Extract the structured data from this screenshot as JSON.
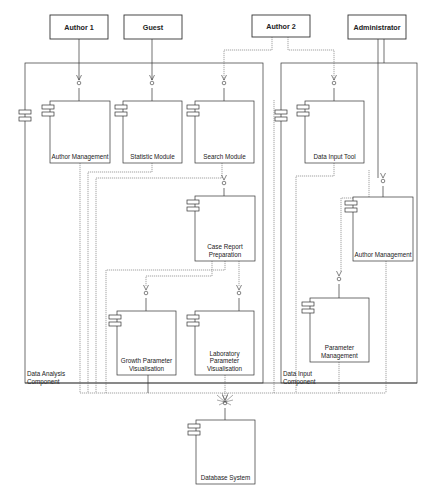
{
  "diagram": {
    "type": "UML component diagram",
    "colors": {
      "line": "#333333",
      "dashed": "#666666",
      "background": "#ffffff"
    },
    "actors": [
      {
        "id": "author1",
        "label": "Author 1",
        "x": 50,
        "y": 15,
        "w": 58,
        "h": 24
      },
      {
        "id": "guest",
        "label": "Guest",
        "x": 124,
        "y": 15,
        "w": 58,
        "h": 24
      },
      {
        "id": "author2",
        "label": "Author 2",
        "x": 252,
        "y": 15,
        "w": 58,
        "h": 22
      },
      {
        "id": "administrator",
        "label": "Administrator",
        "x": 348,
        "y": 15,
        "w": 58,
        "h": 24
      }
    ],
    "frames": [
      {
        "id": "data-analysis",
        "label_lines": [
          "Data Analysis",
          "Component"
        ],
        "x": 25,
        "y": 63,
        "w": 238,
        "h": 320,
        "label_x": 27,
        "label_y": 370
      },
      {
        "id": "data-input",
        "label_lines": [
          "Data Input",
          "Component"
        ],
        "x": 281,
        "y": 63,
        "w": 136,
        "h": 320,
        "label_x": 283,
        "label_y": 370
      }
    ],
    "components": [
      {
        "id": "author-mgmt-1",
        "label_lines": [
          "Author Management"
        ],
        "x": 50,
        "y": 101,
        "w": 60,
        "h": 62
      },
      {
        "id": "statistic-module",
        "label_lines": [
          "Statistic Module"
        ],
        "x": 123,
        "y": 101,
        "w": 59,
        "h": 62
      },
      {
        "id": "search-module",
        "label_lines": [
          "Search Module"
        ],
        "x": 195,
        "y": 101,
        "w": 59,
        "h": 62
      },
      {
        "id": "data-input-tool",
        "label_lines": [
          "Data Input Tool"
        ],
        "x": 305,
        "y": 101,
        "w": 59,
        "h": 62
      },
      {
        "id": "case-report",
        "label_lines": [
          "Case Report",
          "Preparation"
        ],
        "x": 195,
        "y": 196,
        "w": 60,
        "h": 65
      },
      {
        "id": "author-mgmt-2",
        "label_lines": [
          "Author Management"
        ],
        "x": 353,
        "y": 197,
        "w": 60,
        "h": 64
      },
      {
        "id": "growth-param",
        "label_lines": [
          "Growth Parameter",
          "Visualisation"
        ],
        "x": 117,
        "y": 311,
        "w": 59,
        "h": 64
      },
      {
        "id": "lab-param",
        "label_lines": [
          "Laboratory",
          "Parameter",
          "Visualisation"
        ],
        "x": 195,
        "y": 311,
        "w": 59,
        "h": 64
      },
      {
        "id": "param-mgmt",
        "label_lines": [
          "Parameter",
          "Management"
        ],
        "x": 310,
        "y": 298,
        "w": 59,
        "h": 64
      },
      {
        "id": "database-system",
        "label_lines": [
          "Database System"
        ],
        "x": 196,
        "y": 420,
        "w": 59,
        "h": 64
      }
    ],
    "interfaces": [
      {
        "x": 79,
        "y": 82
      },
      {
        "x": 152,
        "y": 82
      },
      {
        "x": 224,
        "y": 82
      },
      {
        "x": 334,
        "y": 82
      },
      {
        "x": 224,
        "y": 182
      },
      {
        "x": 383,
        "y": 180
      },
      {
        "x": 146,
        "y": 292
      },
      {
        "x": 239,
        "y": 292
      },
      {
        "x": 339,
        "y": 278
      },
      {
        "x": 225,
        "y": 402
      }
    ]
  }
}
